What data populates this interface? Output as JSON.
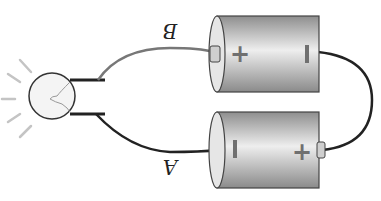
{
  "diagram": {
    "type": "electric circuit",
    "components": {
      "bulb": {
        "name": "light bulb",
        "state": "lit"
      },
      "battery_top": {
        "positive": "+",
        "negative": "−"
      },
      "battery_bottom": {
        "positive": "+",
        "negative": "−"
      }
    },
    "labels": {
      "wire_top": "B",
      "wire_bottom": "A"
    },
    "colors": {
      "battery_light": "#e8e8e8",
      "battery_dark": "#8a8a8a",
      "wire": "#333333",
      "wire_gray": "#777777",
      "sign": "#707070",
      "rays": "#bbbbbb"
    }
  }
}
